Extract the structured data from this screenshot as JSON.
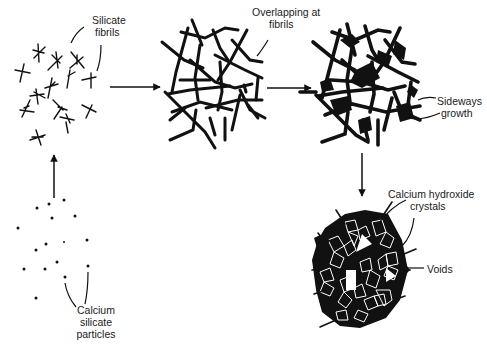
{
  "diagram": {
    "stages": [
      {
        "id": "particles",
        "name": "Calcium silicate particles"
      },
      {
        "id": "fibrils",
        "name": "Silicate fibrils"
      },
      {
        "id": "overlapping",
        "name": "Overlapping at fibrils"
      },
      {
        "id": "sideways",
        "name": "Sideways growth"
      },
      {
        "id": "final",
        "name": "Calcium hydroxide crystals and voids"
      }
    ],
    "arrows": [
      {
        "from": "particles",
        "to": "fibrils",
        "direction": "up"
      },
      {
        "from": "fibrils",
        "to": "overlapping",
        "direction": "right"
      },
      {
        "from": "overlapping",
        "to": "sideways",
        "direction": "right"
      },
      {
        "from": "sideways",
        "to": "final",
        "direction": "down"
      }
    ],
    "colors": {
      "ink": "#111111",
      "background": "#ffffff"
    }
  },
  "labels": {
    "silicate_fibrils": {
      "line1": "Silicate",
      "line2": "fibrils"
    },
    "overlapping": {
      "line1": "Overlapping at",
      "line2": "fibrils"
    },
    "sideways": {
      "line1": "Sideways",
      "line2": "growth"
    },
    "calcium_hydroxide": {
      "line1": "Calcium hydroxide",
      "line2": "crystals"
    },
    "voids": {
      "line1": "Voids"
    },
    "calcium_silicate": {
      "line1": "Calcium",
      "line2": "silicate",
      "line3": "particles"
    }
  }
}
